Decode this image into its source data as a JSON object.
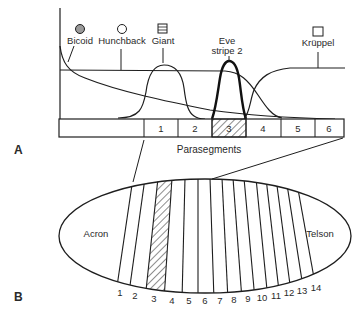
{
  "panels": {
    "a": {
      "label": "A"
    },
    "b": {
      "label": "B"
    }
  },
  "gradients": {
    "bicoid": {
      "label": "Bicoid",
      "icon": "filled-circle-icon",
      "color": "#9a9a9a"
    },
    "hunchback": {
      "label": "Hunchback",
      "icon": "open-circle-icon"
    },
    "giant": {
      "label": "Giant",
      "icon": "striped-square-icon"
    },
    "eve": {
      "label_line1": "Eve",
      "label_line2": "stripe 2"
    },
    "kruppel": {
      "label": "Krüppel",
      "icon": "open-square-icon"
    }
  },
  "parasegment_bar": {
    "axis_label": "Parasegments",
    "cells": [
      "1",
      "2",
      "3",
      "4",
      "5",
      "6"
    ],
    "highlighted": "3"
  },
  "embryo": {
    "anterior_label": "Acron",
    "posterior_label": "Telson",
    "segments": [
      "1",
      "2",
      "3",
      "4",
      "5",
      "6",
      "7",
      "8",
      "9",
      "10",
      "11",
      "12",
      "13",
      "14"
    ],
    "highlighted": "3"
  },
  "colors": {
    "line": "#1e1e1e",
    "text": "#2a2a2a",
    "bicoid_fill": "#9a9a9a"
  }
}
